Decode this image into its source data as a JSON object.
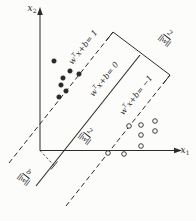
{
  "figure": {
    "axes": {
      "x_axis_label": {
        "base": "x",
        "sub": "1"
      },
      "y_axis_label": {
        "base": "x",
        "sub": "2"
      }
    },
    "lines": {
      "plus_one": {
        "base": "w",
        "sup": "T",
        "rest": "x+b= 1",
        "style": "dashed"
      },
      "zero": {
        "base": "w",
        "sup": "T",
        "rest": "x+b= 0",
        "style": "solid"
      },
      "minus_one": {
        "base": "w",
        "sup": "T",
        "rest": "x+b= −1",
        "style": "dashed"
      }
    },
    "fractions": {
      "margin_top": {
        "num": "2",
        "den": "||w||"
      },
      "margin_mid": {
        "num": "2",
        "den": "||w||"
      },
      "offset": {
        "num": "b",
        "den": "||w||"
      }
    },
    "points": {
      "positive": {
        "marker": "filled-dot",
        "coords": [
          [
            54,
            61
          ],
          [
            70,
            71
          ],
          [
            79,
            74
          ],
          [
            63,
            78
          ],
          [
            61,
            85
          ],
          [
            66,
            91
          ],
          [
            59,
            97
          ]
        ]
      },
      "negative": {
        "marker": "open-circle",
        "coords": [
          [
            129,
            126
          ],
          [
            141,
            125
          ],
          [
            155,
            121
          ],
          [
            141,
            135
          ],
          [
            155,
            131
          ],
          [
            141,
            146
          ],
          [
            108,
            153
          ],
          [
            124,
            154
          ]
        ]
      }
    },
    "colors": {
      "stroke": "#2b2b2b",
      "background": "#fcfcfa"
    }
  }
}
